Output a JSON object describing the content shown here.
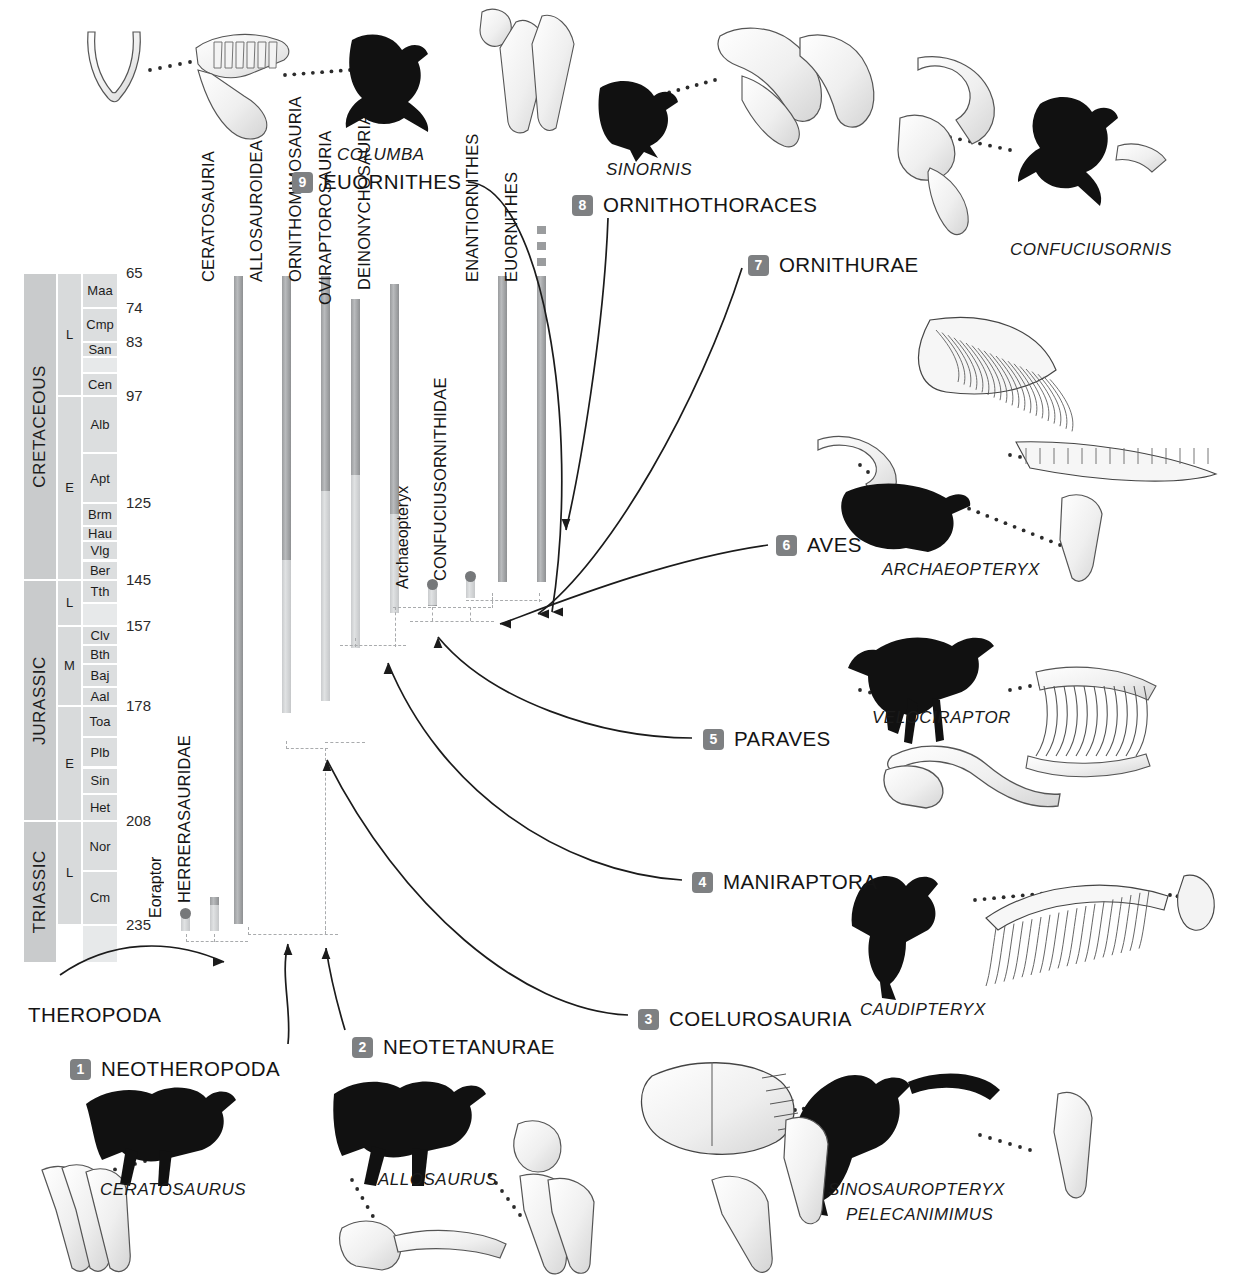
{
  "figure": {
    "type": "cladogram-range-chart"
  },
  "timescale": {
    "axis_label": "Ma",
    "eras": [
      {
        "name": "CRETACEOUS",
        "top_ma": 65,
        "bottom_ma": 145
      },
      {
        "name": "JURASSIC",
        "top_ma": 145,
        "bottom_ma": 208
      },
      {
        "name": "TRIASSIC",
        "top_ma": 208,
        "bottom_ma": 245
      }
    ],
    "epochs": [
      {
        "name": "L",
        "era": "CRETACEOUS",
        "top_ma": 65,
        "bottom_ma": 97
      },
      {
        "name": "E",
        "era": "CRETACEOUS",
        "top_ma": 97,
        "bottom_ma": 145
      },
      {
        "name": "L",
        "era": "JURASSIC",
        "top_ma": 145,
        "bottom_ma": 157
      },
      {
        "name": "M",
        "era": "JURASSIC",
        "top_ma": 157,
        "bottom_ma": 178
      },
      {
        "name": "E",
        "era": "JURASSIC",
        "top_ma": 178,
        "bottom_ma": 208
      },
      {
        "name": "L",
        "era": "TRIASSIC",
        "top_ma": 208,
        "bottom_ma": 235
      }
    ],
    "stages": [
      {
        "name": "Maa",
        "top_ma": 65,
        "bottom_ma": 74
      },
      {
        "name": "Cmp",
        "top_ma": 74,
        "bottom_ma": 83
      },
      {
        "name": "San",
        "top_ma": 83,
        "bottom_ma": 87
      },
      {
        "name": "",
        "top_ma": 87,
        "bottom_ma": 91
      },
      {
        "name": "Cen",
        "top_ma": 91,
        "bottom_ma": 97
      },
      {
        "name": "Alb",
        "top_ma": 97,
        "bottom_ma": 112
      },
      {
        "name": "Apt",
        "top_ma": 112,
        "bottom_ma": 125
      },
      {
        "name": "Brm",
        "top_ma": 125,
        "bottom_ma": 131
      },
      {
        "name": "Hau",
        "top_ma": 131,
        "bottom_ma": 135
      },
      {
        "name": "Vlg",
        "top_ma": 135,
        "bottom_ma": 140
      },
      {
        "name": "Ber",
        "top_ma": 140,
        "bottom_ma": 145
      },
      {
        "name": "Tth",
        "top_ma": 145,
        "bottom_ma": 151
      },
      {
        "name": "",
        "top_ma": 151,
        "bottom_ma": 157
      },
      {
        "name": "Clv",
        "top_ma": 157,
        "bottom_ma": 162
      },
      {
        "name": "Bth",
        "top_ma": 162,
        "bottom_ma": 167
      },
      {
        "name": "Baj",
        "top_ma": 167,
        "bottom_ma": 173
      },
      {
        "name": "Aal",
        "top_ma": 173,
        "bottom_ma": 178
      },
      {
        "name": "Toa",
        "top_ma": 178,
        "bottom_ma": 186
      },
      {
        "name": "Plb",
        "top_ma": 186,
        "bottom_ma": 194
      },
      {
        "name": "Sin",
        "top_ma": 194,
        "bottom_ma": 201
      },
      {
        "name": "Het",
        "top_ma": 201,
        "bottom_ma": 208
      },
      {
        "name": "Nor",
        "top_ma": 208,
        "bottom_ma": 221
      },
      {
        "name": "Cm",
        "top_ma": 221,
        "bottom_ma": 235
      },
      {
        "name": "",
        "top_ma": 235,
        "bottom_ma": 245
      }
    ],
    "age_ticks": [
      65,
      74,
      83,
      97,
      125,
      145,
      157,
      178,
      208,
      235
    ]
  },
  "chart_data": {
    "type": "range-chart",
    "ylabel": "Millions of years ago (Ma)",
    "ylim": [
      245,
      55
    ],
    "grid": false,
    "taxa": [
      {
        "label": "Eoraptor",
        "style": "sentence",
        "top_ma": 232,
        "bottom_ma": 237,
        "cap": true
      },
      {
        "label": "HERRERASAURIDAE",
        "style": "caps",
        "top_ma": 228,
        "bottom_ma": 237,
        "cap": false
      },
      {
        "label": "CERATOSAURIA",
        "style": "caps",
        "top_ma": 66,
        "bottom_ma": 235,
        "cap": false
      },
      {
        "label": "ALLOSAUROIDEA",
        "style": "caps",
        "top_ma": 66,
        "bottom_ma": 180,
        "cap": false
      },
      {
        "label": "ORNITHOMIMOSAURIA",
        "style": "caps",
        "top_ma": 66,
        "bottom_ma": 177,
        "cap": false
      },
      {
        "label": "OVIRAPTOROSAURIA",
        "style": "caps",
        "top_ma": 72,
        "bottom_ma": 163,
        "cap": false
      },
      {
        "label": "DEINONYCHOSAURIA",
        "style": "caps",
        "top_ma": 68,
        "bottom_ma": 154,
        "cap": false
      },
      {
        "label": "Archaeopteryx",
        "style": "sentence",
        "top_ma": 146,
        "bottom_ma": 152,
        "cap": true
      },
      {
        "label": "CONFUCIUSORNITHIDAE",
        "style": "caps",
        "top_ma": 144,
        "bottom_ma": 150,
        "cap": true
      },
      {
        "label": "ENANTIORNITHES",
        "style": "caps",
        "top_ma": 66,
        "bottom_ma": 146,
        "cap": false
      },
      {
        "label": "EUORNITHES",
        "style": "caps",
        "top_ma": 66,
        "bottom_ma": 146,
        "cap": false,
        "extends_to_recent": true
      }
    ],
    "nodes": [
      {
        "number": "",
        "name": "THEROPODA"
      },
      {
        "number": "1",
        "name": "NEOTHEROPODA"
      },
      {
        "number": "2",
        "name": "NEOTETANURAE"
      },
      {
        "number": "3",
        "name": "COELUROSAURIA"
      },
      {
        "number": "4",
        "name": "MANIRAPTORA"
      },
      {
        "number": "5",
        "name": "PARAVES"
      },
      {
        "number": "6",
        "name": "AVES"
      },
      {
        "number": "7",
        "name": "ORNITHURAE"
      },
      {
        "number": "8",
        "name": "ORNITHOTHORACES"
      },
      {
        "number": "9",
        "name": "EUORNITHES"
      }
    ],
    "genus_illustrations": [
      {
        "name": "COLUMBA"
      },
      {
        "name": "SINORNIS"
      },
      {
        "name": "CONFUCIUSORNIS"
      },
      {
        "name": "ARCHAEOPTERYX"
      },
      {
        "name": "VELOCIRAPTOR"
      },
      {
        "name": "CAUDIPTERYX"
      },
      {
        "name": "CERATOSAURUS"
      },
      {
        "name": "ALLOSAURUS"
      },
      {
        "name": "SINOSAUROPTERYX"
      },
      {
        "name": "PELECANIMIMUS"
      }
    ]
  },
  "colors": {
    "bar_dark": "#9a9c9e",
    "bar_light": "#cdcfd1",
    "node_badge": "#7e8082",
    "timescale_era": "#c9cbcc",
    "text": "#141414"
  }
}
